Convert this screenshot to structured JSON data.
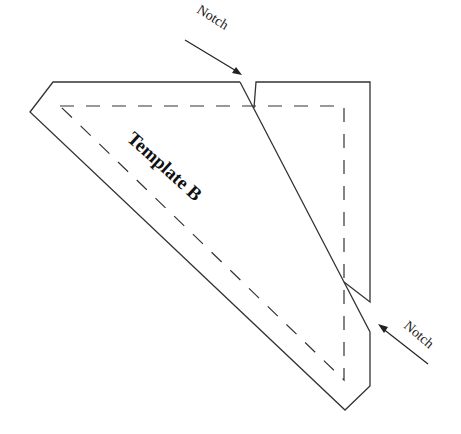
{
  "diagram": {
    "title": "Template B",
    "annotations": [
      {
        "id": "notch-top",
        "label": "Notch"
      },
      {
        "id": "notch-bottom",
        "label": "Notch"
      }
    ],
    "colors": {
      "line": "#333333",
      "background": "#ffffff"
    }
  }
}
